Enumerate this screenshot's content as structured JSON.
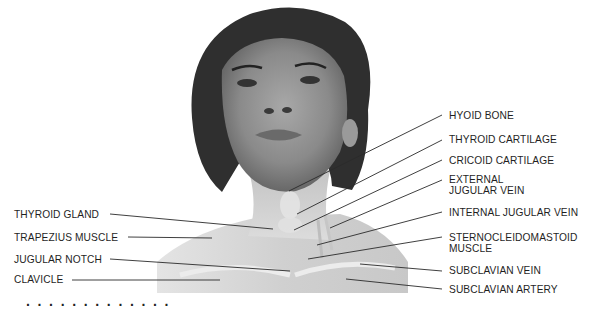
{
  "figure": {
    "labels_left": [
      {
        "id": "thyroid-gland",
        "text": "THYROID GLAND"
      },
      {
        "id": "trapezius-muscle",
        "text": "TRAPEZIUS MUSCLE"
      },
      {
        "id": "jugular-notch",
        "text": "JUGULAR NOTCH"
      },
      {
        "id": "clavicle",
        "text": "CLAVICLE"
      }
    ],
    "labels_right": [
      {
        "id": "hyoid-bone",
        "text": "HYOID BONE"
      },
      {
        "id": "thyroid-cartilage",
        "text": "THYROID CARTILAGE"
      },
      {
        "id": "cricoid-cartilage",
        "text": "CRICOID CARTILAGE"
      },
      {
        "id": "external-jugular-vein",
        "text": "EXTERNAL JUGULAR VEIN"
      },
      {
        "id": "internal-jugular-vein",
        "text": "INTERNAL JUGULAR VEIN"
      },
      {
        "id": "sternocleidomastoid-muscle",
        "text": "STERNOCLEIDOMASTOID MUSCLE"
      },
      {
        "id": "subclavian-vein",
        "text": "SUBCLAVIAN VEIN"
      },
      {
        "id": "subclavian-artery",
        "text": "SUBCLAVIAN ARTERY"
      }
    ],
    "caption_cutoff": "· · · · · · · · · · · · ·"
  },
  "colors": {
    "background": "#ffffff",
    "label_text": "#1f1f1f",
    "leader_line": "#2a2a2a",
    "hair": "#2b2b2b",
    "skin_light": "#d9d9d9",
    "skin_mid": "#b5b5b5",
    "skin_dark": "#8c8c8c"
  }
}
